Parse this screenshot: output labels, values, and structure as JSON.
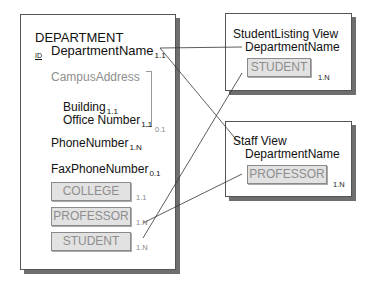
{
  "department": {
    "title": "DEPARTMENT",
    "id_marker": "ID",
    "key_attribute": {
      "name": "DepartmentName",
      "cardinality": "1.1"
    },
    "group": {
      "name": "CampusAddress",
      "cardinality": "0.1",
      "attributes": [
        {
          "name": "Building",
          "cardinality": "1.1"
        },
        {
          "name": "Office Number",
          "cardinality": "1.1"
        }
      ]
    },
    "attributes": [
      {
        "name": "PhoneNumber",
        "cardinality": "1.N"
      },
      {
        "name": "FaxPhoneNumber",
        "cardinality": "0.1"
      }
    ],
    "object_attributes": [
      {
        "name": "COLLEGE",
        "cardinality": "1.1"
      },
      {
        "name": "PROFESSOR",
        "cardinality": "1.N"
      },
      {
        "name": "STUDENT",
        "cardinality": "1.N"
      }
    ]
  },
  "views": [
    {
      "title": "StudentListing View",
      "attribute": "DepartmentName",
      "object": "STUDENT",
      "cardinality": "1.N"
    },
    {
      "title": "Staff View",
      "attribute": "DepartmentName",
      "object": "PROFESSOR",
      "cardinality": "1.N"
    }
  ],
  "colors": {
    "line": "#333333",
    "object_fill": "#e2e2e2",
    "object_text": "#8e8e8e",
    "shadow": "#6e6e6e"
  }
}
